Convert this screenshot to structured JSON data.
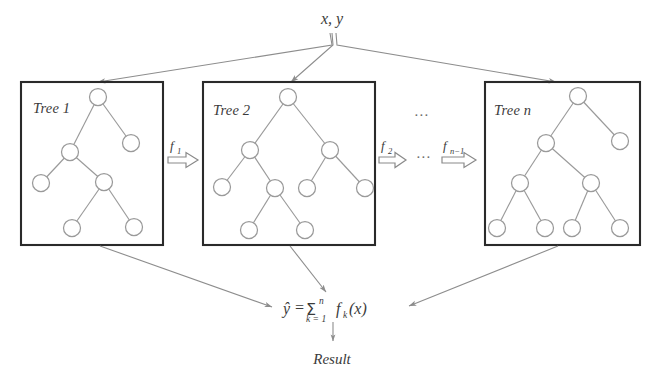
{
  "diagram": {
    "title_text": "x, y",
    "input_label": "x, y",
    "result_label": "Result",
    "ellipsis_between_boxes": "...",
    "ellipsis_between_arrows": "...",
    "colors": {
      "box_stroke": "#2a2a2a",
      "node_stroke": "#9a9a9a",
      "edge_stroke": "#9a9a9a",
      "flow_stroke": "#8d8d8d",
      "text": "#3b3b3b",
      "background": "#ffffff"
    },
    "trees": [
      {
        "label": "Tree 1",
        "box": {
          "x": 21,
          "y": 82,
          "w": 142,
          "h": 163
        },
        "label_pos": {
          "x": 33,
          "y": 113
        },
        "nodes": [
          {
            "id": "r",
            "cx": 98,
            "cy": 97,
            "r": 8.5
          },
          {
            "id": "a",
            "cx": 70,
            "cy": 152,
            "r": 8.5
          },
          {
            "id": "b",
            "cx": 131,
            "cy": 143,
            "r": 8.5
          },
          {
            "id": "c",
            "cx": 41,
            "cy": 183,
            "r": 8.5
          },
          {
            "id": "d",
            "cx": 104,
            "cy": 182,
            "r": 8.5
          },
          {
            "id": "e",
            "cx": 72,
            "cy": 228,
            "r": 8.5
          },
          {
            "id": "f",
            "cx": 134,
            "cy": 227,
            "r": 8.5
          }
        ],
        "edges": [
          [
            "r",
            "a"
          ],
          [
            "r",
            "b"
          ],
          [
            "a",
            "c"
          ],
          [
            "a",
            "d"
          ],
          [
            "d",
            "e"
          ],
          [
            "d",
            "f"
          ]
        ]
      },
      {
        "label": "Tree 2",
        "box": {
          "x": 203,
          "y": 82,
          "w": 172,
          "h": 163
        },
        "label_pos": {
          "x": 213,
          "y": 115
        },
        "nodes": [
          {
            "id": "r",
            "cx": 288,
            "cy": 97,
            "r": 8.5
          },
          {
            "id": "a",
            "cx": 250,
            "cy": 150,
            "r": 8.5
          },
          {
            "id": "b",
            "cx": 330,
            "cy": 150,
            "r": 8.5
          },
          {
            "id": "c",
            "cx": 222,
            "cy": 187,
            "r": 8.5
          },
          {
            "id": "d",
            "cx": 275,
            "cy": 188,
            "r": 8.5
          },
          {
            "id": "e",
            "cx": 307,
            "cy": 188,
            "r": 8.5
          },
          {
            "id": "f",
            "cx": 365,
            "cy": 188,
            "r": 8.5
          },
          {
            "id": "g",
            "cx": 249,
            "cy": 230,
            "r": 8.5
          },
          {
            "id": "h",
            "cx": 305,
            "cy": 230,
            "r": 8.5
          }
        ],
        "edges": [
          [
            "r",
            "a"
          ],
          [
            "r",
            "b"
          ],
          [
            "a",
            "c"
          ],
          [
            "a",
            "d"
          ],
          [
            "b",
            "e"
          ],
          [
            "b",
            "f"
          ],
          [
            "d",
            "g"
          ],
          [
            "d",
            "h"
          ]
        ]
      },
      {
        "label": "Tree n",
        "box": {
          "x": 485,
          "y": 82,
          "w": 155,
          "h": 163
        },
        "label_pos": {
          "x": 494,
          "y": 115
        },
        "nodes": [
          {
            "id": "r",
            "cx": 578,
            "cy": 96,
            "r": 8.5
          },
          {
            "id": "a",
            "cx": 546,
            "cy": 143,
            "r": 8.5
          },
          {
            "id": "b",
            "cx": 620,
            "cy": 141,
            "r": 8.5
          },
          {
            "id": "c",
            "cx": 520,
            "cy": 183,
            "r": 8.5
          },
          {
            "id": "d",
            "cx": 591,
            "cy": 183,
            "r": 8.5
          },
          {
            "id": "e",
            "cx": 497,
            "cy": 228,
            "r": 8.5
          },
          {
            "id": "f",
            "cx": 545,
            "cy": 228,
            "r": 8.5
          },
          {
            "id": "g",
            "cx": 572,
            "cy": 228,
            "r": 8.5
          },
          {
            "id": "h",
            "cx": 620,
            "cy": 228,
            "r": 8.5
          }
        ],
        "edges": [
          [
            "r",
            "a"
          ],
          [
            "r",
            "b"
          ],
          [
            "a",
            "c"
          ],
          [
            "a",
            "d"
          ],
          [
            "c",
            "e"
          ],
          [
            "c",
            "f"
          ],
          [
            "d",
            "g"
          ],
          [
            "d",
            "h"
          ]
        ]
      }
    ],
    "flow_arrows": [
      {
        "name": "f1",
        "base": "f",
        "sub": "1",
        "x": 168,
        "y": 152,
        "w": 30,
        "h": 15
      },
      {
        "name": "f2",
        "base": "f",
        "sub": "2",
        "x": 379,
        "y": 152,
        "w": 27,
        "h": 15
      },
      {
        "name": "fn-1",
        "base": "f",
        "sub": "n−1",
        "x": 443,
        "y": 152,
        "w": 33,
        "h": 15
      }
    ],
    "formula": {
      "lhs": "ŷ",
      "equals": "=",
      "sigma": "Σ",
      "sigma_upper": "n",
      "sigma_lower": "k = 1",
      "term": "f",
      "term_sub": "k",
      "term_arg": "(x)",
      "plain": "ŷ = Σ n k=1 f k (x)"
    }
  }
}
